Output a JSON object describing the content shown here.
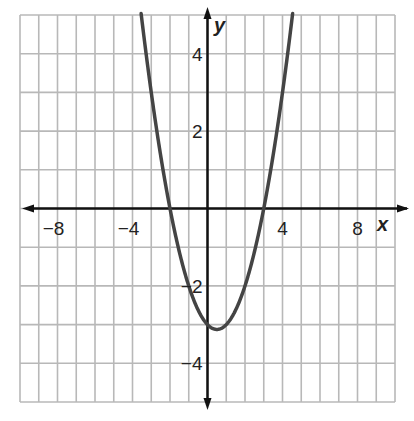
{
  "chart_data": {
    "type": "line",
    "title": "",
    "xlabel": "x",
    "ylabel": "y",
    "xlim": [
      -10,
      10
    ],
    "ylim": [
      -5,
      5
    ],
    "grid": true,
    "x_ticks": [
      {
        "value": -8,
        "label": "−8"
      },
      {
        "value": -4,
        "label": "−4"
      },
      {
        "value": 4,
        "label": "4"
      },
      {
        "value": 8,
        "label": "8"
      }
    ],
    "y_ticks": [
      {
        "value": 4,
        "label": "4"
      },
      {
        "value": 2,
        "label": "2"
      },
      {
        "value": -2,
        "label": "−2"
      },
      {
        "value": -4,
        "label": "−4"
      }
    ],
    "series": [
      {
        "name": "parabola",
        "equation_estimate": "y = 0.5x^2 - 0.5x - 3",
        "x": [
          -3.5,
          -3,
          -2,
          -1,
          0,
          0.5,
          1,
          2,
          3,
          4,
          4.5
        ],
        "y": [
          4.875,
          3,
          0,
          -2,
          -3,
          -3.125,
          -3,
          -2,
          0,
          3,
          4.875
        ]
      }
    ],
    "features": {
      "vertex": [
        0.5,
        -3.1
      ],
      "x_intercepts": [
        -2,
        3
      ],
      "y_intercept": -3
    }
  },
  "colors": {
    "grid": "#b8b8b8",
    "axis": "#111111",
    "curve": "#444444"
  }
}
